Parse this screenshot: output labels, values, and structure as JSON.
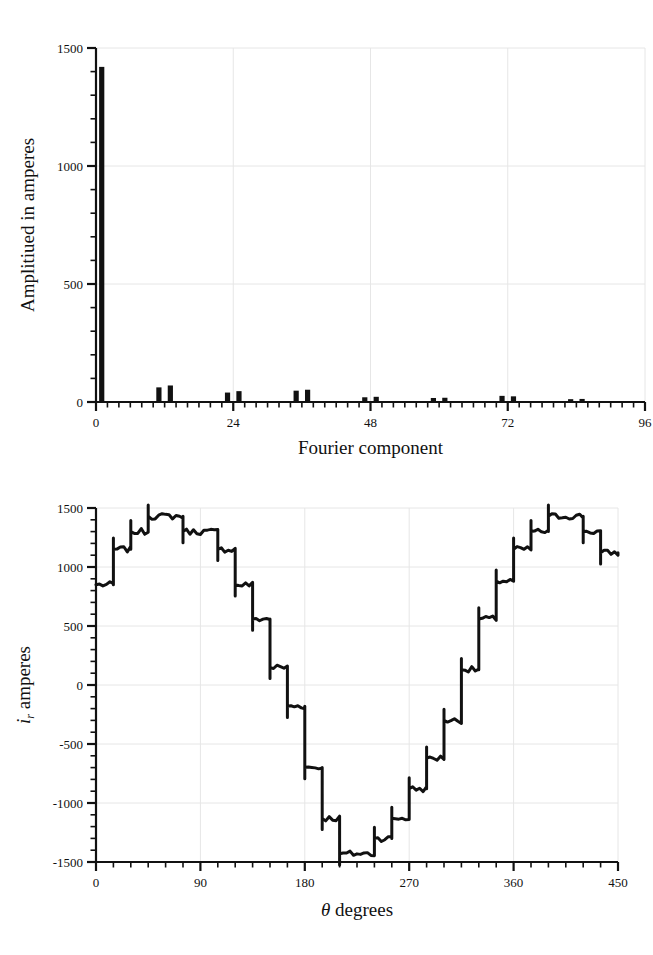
{
  "figure": {
    "background": "#ffffff",
    "ink_color": "#111111",
    "grid_color": "#e6e6e6",
    "panels": [
      "fourier-spectrum",
      "current-waveform"
    ]
  },
  "chart_data": [
    {
      "id": "fourier-spectrum",
      "type": "bar",
      "title": "",
      "xlabel": "Fourier component",
      "ylabel": "Amplitiued in amperes",
      "xlim": [
        0,
        96
      ],
      "ylim": [
        0,
        1500
      ],
      "xticks": [
        0,
        24,
        48,
        72,
        96
      ],
      "xtick_labels": [
        "0",
        "24",
        "48",
        "72",
        "96"
      ],
      "yticks": [
        0,
        500,
        1000,
        1500
      ],
      "ytick_labels": [
        "0",
        "500",
        "1000",
        "1500"
      ],
      "x_minor_step": 2,
      "y_minor_step": 100,
      "grid": true,
      "legend": "none",
      "bar_color": "#111111",
      "categories": [
        1,
        11,
        13,
        23,
        25,
        35,
        37,
        47,
        49,
        59,
        61,
        71,
        73,
        83,
        85
      ],
      "values": [
        1420,
        62,
        70,
        40,
        46,
        48,
        52,
        20,
        22,
        17,
        18,
        26,
        24,
        12,
        13
      ]
    },
    {
      "id": "current-waveform",
      "type": "line",
      "title": "",
      "xlabel": "θ degrees",
      "ylabel": "i_r amperes",
      "xlim": [
        0,
        450
      ],
      "ylim": [
        -1500,
        1500
      ],
      "xticks": [
        0,
        90,
        180,
        270,
        360,
        450
      ],
      "xtick_labels": [
        "0",
        "90",
        "180",
        "270",
        "360",
        "450"
      ],
      "yticks": [
        -1500,
        -1000,
        -500,
        0,
        500,
        1000,
        1500
      ],
      "ytick_labels": [
        "-1500",
        "-1000",
        "-500",
        "0",
        "500",
        "1000",
        "1500"
      ],
      "x_minor_step": 15,
      "y_minor_step": 100,
      "grid": true,
      "legend": "none",
      "line_color": "#111111",
      "line_width": 3,
      "description": "12-step staircase current waveform with switching ripple",
      "x": [
        0,
        15,
        15,
        30,
        30,
        45,
        45,
        75,
        75,
        105,
        105,
        120,
        120,
        135,
        135,
        150,
        150,
        165,
        165,
        180,
        180,
        195,
        195,
        210,
        210,
        240,
        240,
        255,
        255,
        270,
        270,
        285,
        285,
        300,
        300,
        315,
        315,
        330,
        330,
        345,
        345,
        360,
        360,
        375,
        375,
        390,
        390,
        420,
        420,
        435,
        435,
        450
      ],
      "y": [
        850,
        850,
        1150,
        1150,
        1300,
        1300,
        1430,
        1430,
        1300,
        1300,
        1150,
        1150,
        850,
        850,
        560,
        560,
        150,
        150,
        -180,
        -180,
        -700,
        -700,
        -1130,
        -1130,
        -1430,
        -1430,
        -1300,
        -1300,
        -1130,
        -1130,
        -880,
        -880,
        -620,
        -620,
        -300,
        -300,
        130,
        130,
        560,
        560,
        880,
        880,
        1150,
        1150,
        1300,
        1300,
        1430,
        1430,
        1300,
        1300,
        1120,
        1120
      ]
    }
  ],
  "top_chart": {
    "ylabel": "Amplitiued in amperes",
    "xlabel": "Fourier component"
  },
  "bottom_chart": {
    "ylabel_symbol": "i",
    "ylabel_subscript": "r",
    "ylabel_rest": " amperes",
    "xlabel_symbol": "θ",
    "xlabel_rest": " degrees"
  }
}
